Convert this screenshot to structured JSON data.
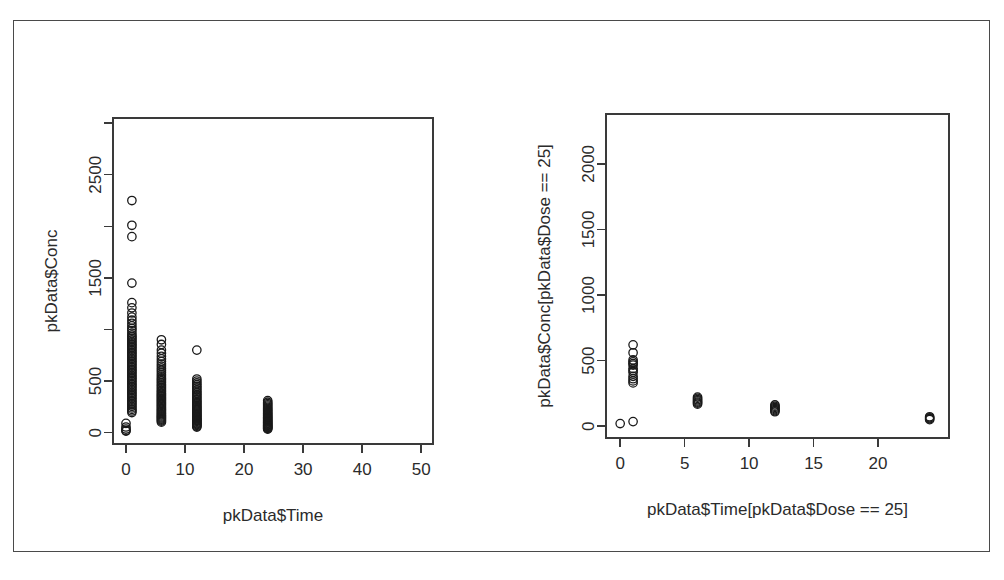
{
  "figure": {
    "background_color": "#ffffff",
    "frame_color": "#4a4a4a",
    "point_color": "#1a1a1a",
    "text_color": "#2b2b2b",
    "panel_count": 2,
    "layout": "1 row x 2 columns"
  },
  "chart_data": [
    {
      "type": "scatter",
      "panel": "left",
      "title": "",
      "xlabel": "pkData$Time",
      "ylabel": "pkData$Conc",
      "xlim": [
        -2.2,
        52
      ],
      "ylim": [
        -110,
        3050
      ],
      "xticks": [
        0,
        10,
        20,
        30,
        40,
        50
      ],
      "xtick_labels": [
        "0",
        "10",
        "20",
        "30",
        "40",
        "50"
      ],
      "yticks": [
        0,
        500,
        1000,
        1500,
        2000,
        2500,
        3000
      ],
      "ytick_labels": [
        "0",
        "500",
        "",
        "1500",
        "",
        "2500",
        ""
      ],
      "grid": false,
      "legend": null,
      "marker": "open-circle",
      "marker_size": 4.2,
      "points": [
        [
          0,
          20
        ],
        [
          0,
          35
        ],
        [
          0,
          55
        ],
        [
          0,
          90
        ],
        [
          0,
          15
        ],
        [
          1,
          2250
        ],
        [
          1,
          2010
        ],
        [
          1,
          1900
        ],
        [
          1,
          1450
        ],
        [
          1,
          1260
        ],
        [
          1,
          1210
        ],
        [
          1,
          1160
        ],
        [
          1,
          1120
        ],
        [
          1,
          1090
        ],
        [
          1,
          1060
        ],
        [
          1,
          1035
        ],
        [
          1,
          1010
        ],
        [
          1,
          990
        ],
        [
          1,
          965
        ],
        [
          1,
          945
        ],
        [
          1,
          930
        ],
        [
          1,
          915
        ],
        [
          1,
          900
        ],
        [
          1,
          885
        ],
        [
          1,
          870
        ],
        [
          1,
          855
        ],
        [
          1,
          840
        ],
        [
          1,
          825
        ],
        [
          1,
          810
        ],
        [
          1,
          795
        ],
        [
          1,
          780
        ],
        [
          1,
          765
        ],
        [
          1,
          750
        ],
        [
          1,
          735
        ],
        [
          1,
          720
        ],
        [
          1,
          705
        ],
        [
          1,
          690
        ],
        [
          1,
          675
        ],
        [
          1,
          660
        ],
        [
          1,
          645
        ],
        [
          1,
          630
        ],
        [
          1,
          615
        ],
        [
          1,
          600
        ],
        [
          1,
          585
        ],
        [
          1,
          570
        ],
        [
          1,
          555
        ],
        [
          1,
          540
        ],
        [
          1,
          525
        ],
        [
          1,
          510
        ],
        [
          1,
          495
        ],
        [
          1,
          480
        ],
        [
          1,
          465
        ],
        [
          1,
          450
        ],
        [
          1,
          435
        ],
        [
          1,
          420
        ],
        [
          1,
          405
        ],
        [
          1,
          390
        ],
        [
          1,
          375
        ],
        [
          1,
          360
        ],
        [
          1,
          345
        ],
        [
          1,
          330
        ],
        [
          1,
          315
        ],
        [
          1,
          300
        ],
        [
          1,
          285
        ],
        [
          1,
          270
        ],
        [
          1,
          255
        ],
        [
          1,
          240
        ],
        [
          1,
          225
        ],
        [
          1,
          210
        ],
        [
          1,
          195
        ],
        [
          6,
          900
        ],
        [
          6,
          855
        ],
        [
          6,
          800
        ],
        [
          6,
          770
        ],
        [
          6,
          740
        ],
        [
          6,
          715
        ],
        [
          6,
          690
        ],
        [
          6,
          665
        ],
        [
          6,
          645
        ],
        [
          6,
          625
        ],
        [
          6,
          605
        ],
        [
          6,
          585
        ],
        [
          6,
          565
        ],
        [
          6,
          548
        ],
        [
          6,
          530
        ],
        [
          6,
          515
        ],
        [
          6,
          500
        ],
        [
          6,
          485
        ],
        [
          6,
          470
        ],
        [
          6,
          455
        ],
        [
          6,
          440
        ],
        [
          6,
          425
        ],
        [
          6,
          410
        ],
        [
          6,
          398
        ],
        [
          6,
          385
        ],
        [
          6,
          372
        ],
        [
          6,
          360
        ],
        [
          6,
          348
        ],
        [
          6,
          336
        ],
        [
          6,
          324
        ],
        [
          6,
          312
        ],
        [
          6,
          300
        ],
        [
          6,
          288
        ],
        [
          6,
          276
        ],
        [
          6,
          264
        ],
        [
          6,
          252
        ],
        [
          6,
          240
        ],
        [
          6,
          228
        ],
        [
          6,
          216
        ],
        [
          6,
          205
        ],
        [
          6,
          194
        ],
        [
          6,
          183
        ],
        [
          6,
          172
        ],
        [
          6,
          162
        ],
        [
          6,
          152
        ],
        [
          6,
          142
        ],
        [
          6,
          132
        ],
        [
          6,
          122
        ],
        [
          6,
          112
        ],
        [
          6,
          102
        ],
        [
          12,
          800
        ],
        [
          12,
          520
        ],
        [
          12,
          500
        ],
        [
          12,
          482
        ],
        [
          12,
          465
        ],
        [
          12,
          448
        ],
        [
          12,
          432
        ],
        [
          12,
          416
        ],
        [
          12,
          400
        ],
        [
          12,
          385
        ],
        [
          12,
          370
        ],
        [
          12,
          356
        ],
        [
          12,
          342
        ],
        [
          12,
          328
        ],
        [
          12,
          315
        ],
        [
          12,
          302
        ],
        [
          12,
          290
        ],
        [
          12,
          278
        ],
        [
          12,
          266
        ],
        [
          12,
          254
        ],
        [
          12,
          243
        ],
        [
          12,
          232
        ],
        [
          12,
          221
        ],
        [
          12,
          210
        ],
        [
          12,
          200
        ],
        [
          12,
          190
        ],
        [
          12,
          180
        ],
        [
          12,
          170
        ],
        [
          12,
          161
        ],
        [
          12,
          152
        ],
        [
          12,
          143
        ],
        [
          12,
          134
        ],
        [
          12,
          126
        ],
        [
          12,
          118
        ],
        [
          12,
          110
        ],
        [
          12,
          102
        ],
        [
          12,
          94
        ],
        [
          12,
          86
        ],
        [
          12,
          78
        ],
        [
          12,
          70
        ],
        [
          12,
          62
        ],
        [
          12,
          54
        ],
        [
          24,
          310
        ],
        [
          24,
          295
        ],
        [
          24,
          282
        ],
        [
          24,
          270
        ],
        [
          24,
          258
        ],
        [
          24,
          246
        ],
        [
          24,
          235
        ],
        [
          24,
          224
        ],
        [
          24,
          214
        ],
        [
          24,
          204
        ],
        [
          24,
          194
        ],
        [
          24,
          185
        ],
        [
          24,
          176
        ],
        [
          24,
          167
        ],
        [
          24,
          158
        ],
        [
          24,
          150
        ],
        [
          24,
          142
        ],
        [
          24,
          134
        ],
        [
          24,
          126
        ],
        [
          24,
          118
        ],
        [
          24,
          111
        ],
        [
          24,
          104
        ],
        [
          24,
          97
        ],
        [
          24,
          90
        ],
        [
          24,
          83
        ],
        [
          24,
          76
        ],
        [
          24,
          70
        ],
        [
          24,
          64
        ],
        [
          24,
          58
        ],
        [
          24,
          52
        ],
        [
          24,
          46
        ],
        [
          24,
          40
        ],
        [
          24,
          34
        ]
      ]
    },
    {
      "type": "scatter",
      "panel": "right",
      "title": "",
      "xlabel": "pkData$Time[pkData$Dose == 25]",
      "ylabel": "pkData$Conc[pkData$Dose == 25]",
      "xlim": [
        -1.1,
        25.5
      ],
      "ylim": [
        -90,
        2380
      ],
      "xticks": [
        0,
        5,
        10,
        15,
        20
      ],
      "xtick_labels": [
        "0",
        "5",
        "10",
        "15",
        "20"
      ],
      "yticks": [
        0,
        500,
        1000,
        1500,
        2000
      ],
      "ytick_labels": [
        "0",
        "500",
        "1000",
        "1500",
        "2000"
      ],
      "grid": false,
      "legend": null,
      "marker": "open-circle",
      "marker_size": 4.2,
      "points": [
        [
          0,
          20
        ],
        [
          1,
          35
        ],
        [
          1,
          620
        ],
        [
          1,
          560
        ],
        [
          1,
          505
        ],
        [
          1,
          490
        ],
        [
          1,
          478
        ],
        [
          1,
          466
        ],
        [
          1,
          440
        ],
        [
          1,
          425
        ],
        [
          1,
          410
        ],
        [
          1,
          380
        ],
        [
          1,
          362
        ],
        [
          1,
          345
        ],
        [
          1,
          330
        ],
        [
          6,
          222
        ],
        [
          6,
          212
        ],
        [
          6,
          202
        ],
        [
          6,
          193
        ],
        [
          6,
          184
        ],
        [
          6,
          176
        ],
        [
          6,
          168
        ],
        [
          12,
          162
        ],
        [
          12,
          152
        ],
        [
          12,
          143
        ],
        [
          12,
          134
        ],
        [
          12,
          126
        ],
        [
          12,
          118
        ],
        [
          12,
          110
        ],
        [
          24,
          72
        ],
        [
          24,
          64
        ],
        [
          24,
          57
        ],
        [
          24,
          50
        ]
      ]
    }
  ]
}
